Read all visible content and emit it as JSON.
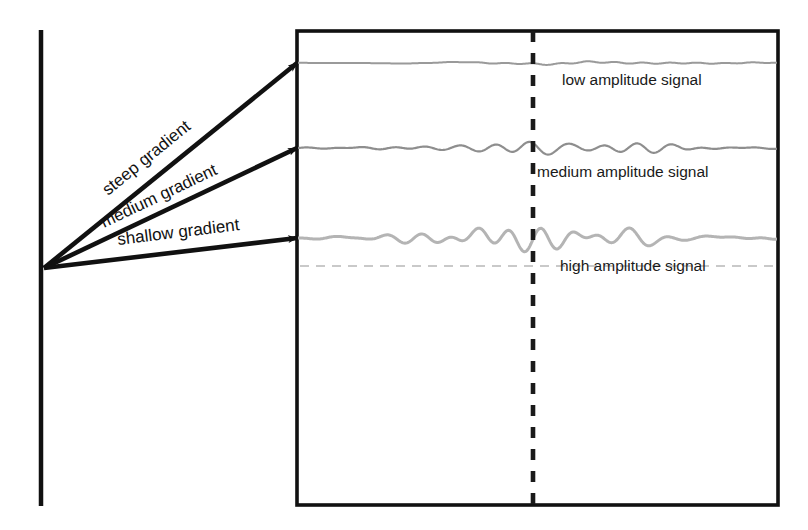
{
  "figure": {
    "type": "schematic-diagram",
    "background_color": "#ffffff",
    "line_color": "#111111",
    "signal_color_low": "#9a9a9a",
    "signal_color_medium": "#8e8e8e",
    "signal_color_high": "#b4b4b4",
    "dashed_marker_color": "#1a1a1a",
    "baseline_dashed_color": "#c9c9c9"
  },
  "left_axis": {
    "name": "vertical-axis-line",
    "x": 41,
    "y_top": 30,
    "y_bottom": 506
  },
  "panel": {
    "name": "signal-panel",
    "x": 297,
    "y": 31,
    "width": 481,
    "height": 474
  },
  "marker_line": {
    "name": "dashed-time-marker",
    "x": 533,
    "style": "dashed"
  },
  "arrows": [
    {
      "id": "steep",
      "label": "steep gradient",
      "from_x": 44,
      "from_y": 268,
      "to_x": 297,
      "to_y": 63,
      "label_x": 108,
      "label_y": 196,
      "label_rotation": -39
    },
    {
      "id": "medium",
      "label": "medium gradient",
      "from_x": 44,
      "from_y": 268,
      "to_x": 297,
      "to_y": 148,
      "label_x": 104,
      "label_y": 228,
      "label_rotation": -25.4
    },
    {
      "id": "shallow",
      "label": "shallow gradient",
      "from_x": 44,
      "from_y": 268,
      "to_x": 297,
      "to_y": 238,
      "label_x": 118,
      "label_y": 245,
      "label_rotation": -7
    }
  ],
  "signals": [
    {
      "id": "low",
      "label": "low amplitude signal",
      "baseline_y": 63,
      "amplitude": "low",
      "label_x": 562,
      "label_y": 81,
      "color": "#9a9a9a",
      "stroke_width": 2
    },
    {
      "id": "medium",
      "label": "medium amplitude signal",
      "baseline_y": 148,
      "amplitude": "medium",
      "label_x": 537,
      "label_y": 173,
      "color": "#8e8e8e",
      "stroke_width": 2.2
    },
    {
      "id": "high",
      "label": "high amplitude signal",
      "baseline_y": 238,
      "amplitude": "high",
      "label_x": 560,
      "label_y": 267,
      "color": "#b4b4b4",
      "stroke_width": 3,
      "baseline_dashed_y": 266
    }
  ],
  "chart_data": {
    "type": "line",
    "title": "",
    "xlabel": "",
    "ylabel": "",
    "series": [
      {
        "name": "low amplitude signal",
        "baseline_y": 63,
        "peak_amplitude_px": 4,
        "arrow_label": "steep gradient"
      },
      {
        "name": "medium amplitude signal",
        "baseline_y": 148,
        "peak_amplitude_px": 11,
        "arrow_label": "medium gradient"
      },
      {
        "name": "high amplitude signal",
        "baseline_y": 238,
        "peak_amplitude_px": 28,
        "arrow_label": "shallow gradient"
      }
    ],
    "marker_x": 533,
    "grid": false,
    "legend": "inline-annotations"
  }
}
